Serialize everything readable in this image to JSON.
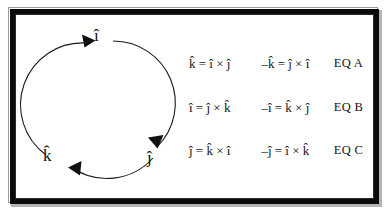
{
  "figure": {
    "frame_color": "#0b0b0b",
    "background": "#ffffff",
    "ink_color": "#111111"
  },
  "cycle": {
    "direction": "clockwise",
    "nodes": [
      {
        "id": "i",
        "label": "î",
        "position": "top"
      },
      {
        "id": "j",
        "label": "ĵ",
        "position": "bottom-right"
      },
      {
        "id": "k",
        "label": "k̂",
        "position": "bottom-left"
      }
    ],
    "arrow_sequence": "i → j → k → i"
  },
  "equations": {
    "rows": [
      {
        "left": "k̂ = î × ĵ",
        "right": "–k̂ = ĵ × î",
        "tag": "EQ A"
      },
      {
        "left": "î = ĵ × k̂",
        "right": "–î = k̂ × ĵ",
        "tag": "EQ B"
      },
      {
        "left": "ĵ = k̂ × î",
        "right": "–ĵ = î × k̂",
        "tag": "EQ C"
      }
    ]
  }
}
